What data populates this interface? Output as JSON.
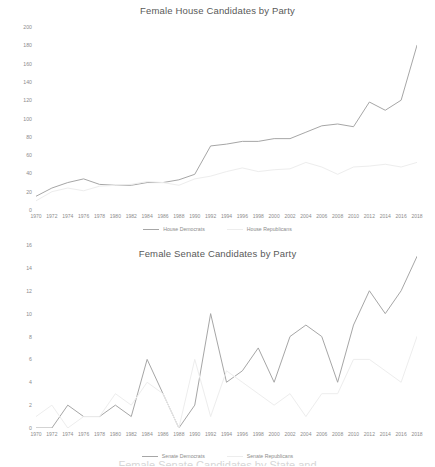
{
  "colors": {
    "democrat_line": "#a6a6a6",
    "republican_line": "#ededed",
    "title_text": "#595959",
    "axis_text": "#8c8c8c",
    "background": "#ffffff"
  },
  "house": {
    "title": "Female House Candidates by Party",
    "legend": [
      {
        "label": "House Democrats",
        "color": "#a6a6a6"
      },
      {
        "label": "House Republicans",
        "color": "#ededed"
      }
    ]
  },
  "senate": {
    "title": "Female Senate Candidates by Party",
    "legend": [
      {
        "label": "Senate Democrats",
        "color": "#a6a6a6"
      },
      {
        "label": "Senate Republicans",
        "color": "#ededed"
      }
    ]
  },
  "footer": {
    "partial_text": "Female Senate Candidates by State and"
  },
  "chart_data": [
    {
      "type": "line",
      "title": "Female House Candidates by Party",
      "xlabel": "",
      "ylabel": "",
      "grid": false,
      "legend_position": "bottom",
      "ylim": [
        0,
        200
      ],
      "yticks": [
        0,
        20,
        40,
        60,
        80,
        100,
        120,
        140,
        160,
        180,
        200
      ],
      "categories": [
        1970,
        1972,
        1974,
        1976,
        1978,
        1980,
        1982,
        1984,
        1986,
        1988,
        1990,
        1992,
        1994,
        1996,
        1998,
        2000,
        2002,
        2004,
        2006,
        2008,
        2010,
        2012,
        2014,
        2016,
        2018
      ],
      "series": [
        {
          "name": "House Democrats",
          "color": "#a6a6a6",
          "values": [
            15,
            24,
            30,
            34,
            28,
            27,
            27,
            30,
            30,
            33,
            39,
            70,
            72,
            75,
            75,
            78,
            78,
            85,
            92,
            94,
            91,
            118,
            109,
            120,
            180
          ]
        },
        {
          "name": "House Republicans",
          "color": "#ededed",
          "values": [
            10,
            20,
            24,
            21,
            26,
            27,
            28,
            31,
            30,
            27,
            34,
            37,
            42,
            46,
            42,
            44,
            45,
            52,
            47,
            39,
            47,
            48,
            50,
            47,
            52
          ]
        }
      ]
    },
    {
      "type": "line",
      "title": "Female Senate Candidates by Party",
      "xlabel": "",
      "ylabel": "",
      "grid": false,
      "legend_position": "bottom",
      "ylim": [
        0,
        16
      ],
      "yticks": [
        0,
        2,
        4,
        6,
        8,
        10,
        12,
        14,
        16
      ],
      "categories": [
        1970,
        1972,
        1974,
        1976,
        1978,
        1980,
        1982,
        1984,
        1986,
        1988,
        1990,
        1992,
        1994,
        1996,
        1998,
        2000,
        2002,
        2004,
        2006,
        2008,
        2010,
        2012,
        2014,
        2016,
        2018
      ],
      "series": [
        {
          "name": "Senate Democrats",
          "color": "#a6a6a6",
          "values": [
            0,
            0,
            2,
            1,
            1,
            2,
            1,
            6,
            3,
            0,
            2,
            10,
            4,
            5,
            7,
            4,
            8,
            9,
            8,
            4,
            9,
            12,
            10,
            12,
            15
          ]
        },
        {
          "name": "Senate Republicans",
          "color": "#ededed",
          "values": [
            1,
            2,
            0,
            1,
            1,
            3,
            2,
            4,
            3,
            0,
            6,
            1,
            5,
            4,
            3,
            2,
            3,
            1,
            3,
            3,
            6,
            6,
            5,
            4,
            8
          ]
        }
      ]
    }
  ]
}
